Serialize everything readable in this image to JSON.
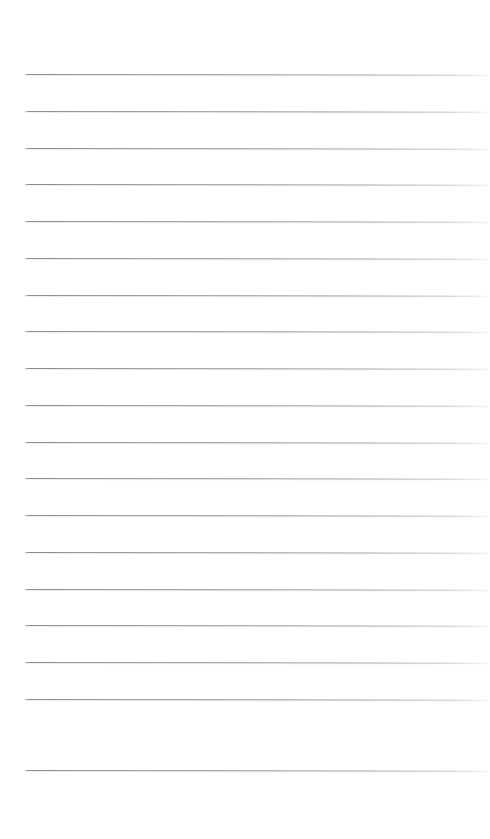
{
  "document": {
    "type": "ruled-notebook-page",
    "title": "Blank ruled page",
    "background_color": "#ffffff",
    "width_px": 490,
    "height_px": 839,
    "content_text": ""
  },
  "ruling": {
    "line_color": "#8c8c90",
    "line_count": 19,
    "line_thickness_px": 1,
    "line_spacing_px": 36.7,
    "first_line_y_px": 74,
    "last_line_y_px": 770,
    "line_left_x_px": 25,
    "line_right_x_px": 487,
    "line_width_px": 462,
    "slant_degrees": 0.085,
    "top_margin_px": 74,
    "bottom_margin_px": 69,
    "left_margin_px": 25,
    "right_margin_px": 3,
    "lines": [
      {
        "index": 1,
        "y": 74,
        "text": ""
      },
      {
        "index": 2,
        "y": 111,
        "text": ""
      },
      {
        "index": 3,
        "y": 148,
        "text": ""
      },
      {
        "index": 4,
        "y": 184,
        "text": ""
      },
      {
        "index": 5,
        "y": 221,
        "text": ""
      },
      {
        "index": 6,
        "y": 258,
        "text": ""
      },
      {
        "index": 7,
        "y": 295,
        "text": ""
      },
      {
        "index": 8,
        "y": 331,
        "text": ""
      },
      {
        "index": 9,
        "y": 368,
        "text": ""
      },
      {
        "index": 10,
        "y": 405,
        "text": ""
      },
      {
        "index": 11,
        "y": 442,
        "text": ""
      },
      {
        "index": 12,
        "y": 478,
        "text": ""
      },
      {
        "index": 13,
        "y": 515,
        "text": ""
      },
      {
        "index": 14,
        "y": 552,
        "text": ""
      },
      {
        "index": 15,
        "y": 589,
        "text": ""
      },
      {
        "index": 16,
        "y": 625,
        "text": ""
      },
      {
        "index": 17,
        "y": 662,
        "text": ""
      },
      {
        "index": 18,
        "y": 699,
        "text": ""
      },
      {
        "index": 19,
        "y": 770,
        "text": ""
      }
    ]
  }
}
